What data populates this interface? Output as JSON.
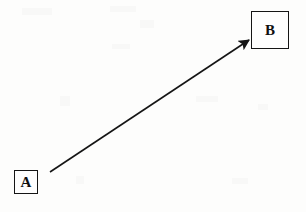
{
  "diagram": {
    "title": "",
    "background_color": "#fdfdfc",
    "stroke_color": "#151515",
    "width": 306,
    "height": 212,
    "nodes": [
      {
        "id": "A",
        "label": "A",
        "shape": "square",
        "x": 14,
        "y": 170,
        "width": 24,
        "height": 24
      },
      {
        "id": "B",
        "label": "B",
        "shape": "square",
        "x": 251,
        "y": 11,
        "width": 38,
        "height": 38
      }
    ],
    "edges": [
      {
        "id": "A-to-B",
        "from": "A",
        "to": "B",
        "label": "",
        "style": "solid",
        "arrowhead": "filled-triangle",
        "x1": 50,
        "y1": 172,
        "x2": 249,
        "y2": 40
      }
    ]
  }
}
